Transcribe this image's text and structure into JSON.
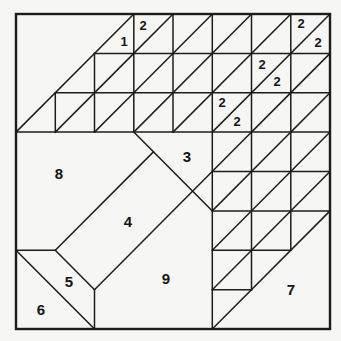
{
  "figure": {
    "canvas": {
      "width": 341,
      "height": 341,
      "background": "#f6f6f4",
      "line_color": "#1c1c1c"
    },
    "border": {
      "x": 16,
      "y": 14,
      "x2": 330,
      "y2": 329,
      "stroke_width": 2.4
    },
    "line_stroke_width": 1.5,
    "segments": [
      [
        94.5,
        53.4,
        330,
        53.4
      ],
      [
        55.3,
        92.8,
        330,
        92.8
      ],
      [
        16,
        132.1,
        330,
        132.1
      ],
      [
        212.3,
        171.5,
        330,
        171.5
      ],
      [
        212.3,
        210.9,
        330,
        210.9
      ],
      [
        212.3,
        250.3,
        290.8,
        250.3
      ],
      [
        212.3,
        289.7,
        251.5,
        289.7
      ],
      [
        16,
        250.3,
        55.3,
        250.3
      ],
      [
        55.3,
        92.8,
        55.3,
        132.1
      ],
      [
        94.5,
        53.4,
        94.5,
        132.1
      ],
      [
        133.8,
        14,
        133.8,
        132.1
      ],
      [
        173,
        14,
        173,
        132.1
      ],
      [
        212.3,
        14,
        212.3,
        329
      ],
      [
        251.5,
        14,
        251.5,
        289.7
      ],
      [
        290.8,
        14,
        290.8,
        250.3
      ],
      [
        94.5,
        289.7,
        94.5,
        329
      ],
      [
        16,
        132.1,
        133.8,
        14
      ],
      [
        55.3,
        132.1,
        133.8,
        53.4
      ],
      [
        94.5,
        132.1,
        133.8,
        92.8
      ],
      [
        133.8,
        53.4,
        173,
        14
      ],
      [
        133.8,
        92.8,
        212.3,
        14
      ],
      [
        133.8,
        132.1,
        251.5,
        14
      ],
      [
        173,
        132.1,
        290.8,
        14
      ],
      [
        212.3,
        132.1,
        330,
        14
      ],
      [
        251.5,
        132.1,
        330,
        53.4
      ],
      [
        290.8,
        132.1,
        330,
        92.8
      ],
      [
        94.5,
        289.7,
        251.5,
        132.1
      ],
      [
        212.3,
        210.9,
        290.8,
        132.1
      ],
      [
        212.3,
        250.3,
        330,
        132.1
      ],
      [
        212.3,
        289.7,
        330,
        171.5
      ],
      [
        212.3,
        329,
        330,
        210.9
      ],
      [
        133.8,
        132.1,
        212.3,
        210.9
      ],
      [
        55.3,
        250.3,
        153.4,
        151.9
      ],
      [
        16,
        250.3,
        94.5,
        329
      ],
      [
        55.3,
        250.3,
        94.5,
        289.7
      ]
    ],
    "labels": [
      {
        "text": "1",
        "x": 124,
        "y": 41,
        "size": 13
      },
      {
        "text": "2",
        "x": 143,
        "y": 25,
        "size": 13
      },
      {
        "text": "2",
        "x": 301,
        "y": 23,
        "size": 13
      },
      {
        "text": "2",
        "x": 318,
        "y": 42,
        "size": 13
      },
      {
        "text": "2",
        "x": 262,
        "y": 64,
        "size": 13
      },
      {
        "text": "2",
        "x": 277,
        "y": 81,
        "size": 13
      },
      {
        "text": "2",
        "x": 222,
        "y": 102,
        "size": 13
      },
      {
        "text": "2",
        "x": 237,
        "y": 121,
        "size": 13
      },
      {
        "text": "3",
        "x": 187,
        "y": 156,
        "size": 15
      },
      {
        "text": "4",
        "x": 128,
        "y": 221,
        "size": 15
      },
      {
        "text": "5",
        "x": 69,
        "y": 281,
        "size": 15
      },
      {
        "text": "6",
        "x": 41,
        "y": 309,
        "size": 15
      },
      {
        "text": "7",
        "x": 291,
        "y": 289,
        "size": 15
      },
      {
        "text": "8",
        "x": 59,
        "y": 173,
        "size": 15
      },
      {
        "text": "9",
        "x": 166,
        "y": 278,
        "size": 15
      }
    ]
  }
}
